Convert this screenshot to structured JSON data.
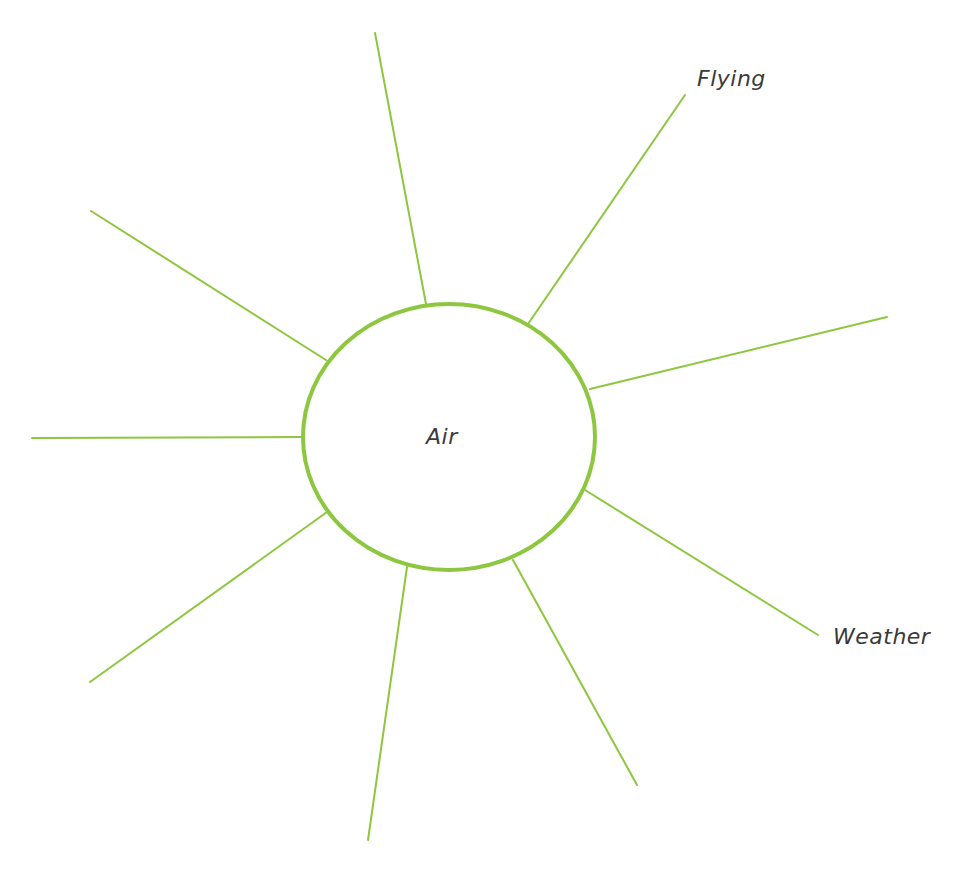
{
  "diagram": {
    "type": "spider-diagram",
    "colors": {
      "stroke": "#8dc63f",
      "text": "#3a3a3a",
      "background": "#ffffff"
    },
    "center": {
      "label": "Air",
      "cx": 449,
      "cy": 437,
      "rx": 146,
      "ry": 133
    },
    "spokes": [
      {
        "id": "spoke-top",
        "x1": 426,
        "y1": 304,
        "x2": 375,
        "y2": 33,
        "label": ""
      },
      {
        "id": "spoke-top-right",
        "x1": 528,
        "y1": 324,
        "x2": 685,
        "y2": 95,
        "label": "Flying"
      },
      {
        "id": "spoke-right",
        "x1": 590,
        "y1": 389,
        "x2": 887,
        "y2": 317,
        "label": ""
      },
      {
        "id": "spoke-lower-right",
        "x1": 585,
        "y1": 490,
        "x2": 818,
        "y2": 635,
        "label": "Weather"
      },
      {
        "id": "spoke-bottom-right",
        "x1": 513,
        "y1": 560,
        "x2": 637,
        "y2": 785,
        "label": ""
      },
      {
        "id": "spoke-bottom",
        "x1": 407,
        "y1": 567,
        "x2": 368,
        "y2": 840,
        "label": ""
      },
      {
        "id": "spoke-lower-left",
        "x1": 327,
        "y1": 512,
        "x2": 90,
        "y2": 682,
        "label": ""
      },
      {
        "id": "spoke-left",
        "x1": 303,
        "y1": 437,
        "x2": 32,
        "y2": 438,
        "label": ""
      },
      {
        "id": "spoke-upper-left",
        "x1": 326,
        "y1": 360,
        "x2": 91,
        "y2": 211,
        "label": ""
      }
    ],
    "labels": {
      "center": "Air",
      "flying": "Flying",
      "weather": "Weather"
    }
  }
}
